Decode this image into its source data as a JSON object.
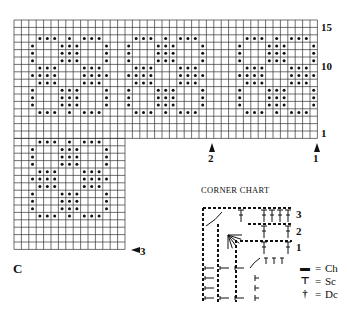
{
  "main_chart": {
    "letter": "C",
    "row_labels": [
      {
        "text": "15",
        "row": 1
      },
      {
        "text": "10",
        "row": 6
      },
      {
        "text": "1",
        "row": 15
      }
    ],
    "arrows": [
      {
        "text": "2",
        "direction": "up"
      },
      {
        "text": "1",
        "direction": "up"
      },
      {
        "text": "3",
        "direction": "left"
      }
    ],
    "grid": {
      "top_section": {
        "cols": 41,
        "rows": 16
      },
      "bottom_section": {
        "cols": 15,
        "rows": 15
      }
    },
    "motif": [
      ".XXX.X.XXX.",
      "X...XXX...X",
      "X...XXX...X",
      "X...XXX...X",
      ".XXX...XXX.",
      "XXXX...XXXX",
      ".XXX...XXX.",
      "X...XXX...X",
      "X...XXX...X",
      "X...XXX...X",
      ".XXX.X.XXX."
    ],
    "motif_positions": [
      {
        "col": 2,
        "row": 2
      },
      {
        "col": 15,
        "row": 2
      },
      {
        "col": 30,
        "row": 2
      },
      {
        "col": 2,
        "row": 16
      }
    ]
  },
  "corner_chart": {
    "title": "CORNER CHART",
    "rows": [
      "3",
      "2",
      "1"
    ]
  },
  "legend": [
    {
      "symbol": "chain-symbol",
      "glyph": "▬",
      "eq": "=",
      "text": "Ch"
    },
    {
      "symbol": "sc-symbol",
      "glyph": "⊤",
      "eq": "=",
      "text": "Sc"
    },
    {
      "symbol": "dc-symbol",
      "glyph": "†",
      "eq": "=",
      "text": "Dc"
    }
  ]
}
